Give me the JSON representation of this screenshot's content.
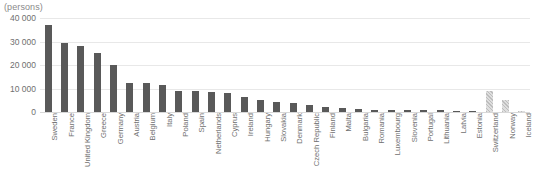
{
  "chart_data": {
    "type": "bar",
    "title": "",
    "subtitle": "",
    "xlabel": "",
    "ylabel": "(persons)",
    "unit_label": "(persons)",
    "ylim": [
      0,
      40000
    ],
    "ytick_values": [
      0,
      10000,
      20000,
      30000,
      40000
    ],
    "ytick_labels": [
      "0",
      "10 000",
      "20 000",
      "30 000",
      "40 000"
    ],
    "grid": true,
    "legend": "none",
    "bar_color": "#595959",
    "highlight_color": "#c9c9c9",
    "categories": [
      "Sweden",
      "France",
      "United Kingdom",
      "Greece",
      "Germany",
      "Austria",
      "Belgium",
      "Italy",
      "Poland",
      "Spain",
      "Netherlands",
      "Cyprus",
      "Ireland",
      "Hungary",
      "Slovakia",
      "Denmark",
      "Czech Republic",
      "Finland",
      "Malta",
      "Bulgaria",
      "Romania",
      "Luxembourg",
      "Slovenia",
      "Portugal",
      "Lithuania",
      "Latvia",
      "Estonia",
      "Switzerland",
      "Norway",
      "Iceland"
    ],
    "values": [
      37000,
      29500,
      28000,
      25000,
      20000,
      12500,
      12200,
      11500,
      9000,
      8800,
      8600,
      8300,
      6500,
      5200,
      4400,
      3800,
      2800,
      2100,
      1700,
      1300,
      1000,
      900,
      800,
      700,
      650,
      550,
      450,
      9000,
      5200,
      300
    ],
    "hatched_indices": [
      27,
      28,
      29
    ]
  }
}
